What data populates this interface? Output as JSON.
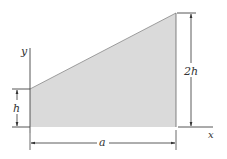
{
  "diagram": {
    "shape": {
      "description": "trapezoidal area",
      "fill": "#d9d9d9",
      "stroke": "#555555",
      "vertices": [
        [
          30,
          127
        ],
        [
          30,
          89
        ],
        [
          176,
          13
        ],
        [
          176,
          127
        ]
      ]
    },
    "axes": {
      "x_label": "x",
      "y_label": "y"
    },
    "dimensions": {
      "left_height": "h",
      "right_height": "2h",
      "width": "a"
    },
    "colors": {
      "line": "#444444",
      "text": "#333333",
      "fill": "#d9d9d9"
    }
  }
}
